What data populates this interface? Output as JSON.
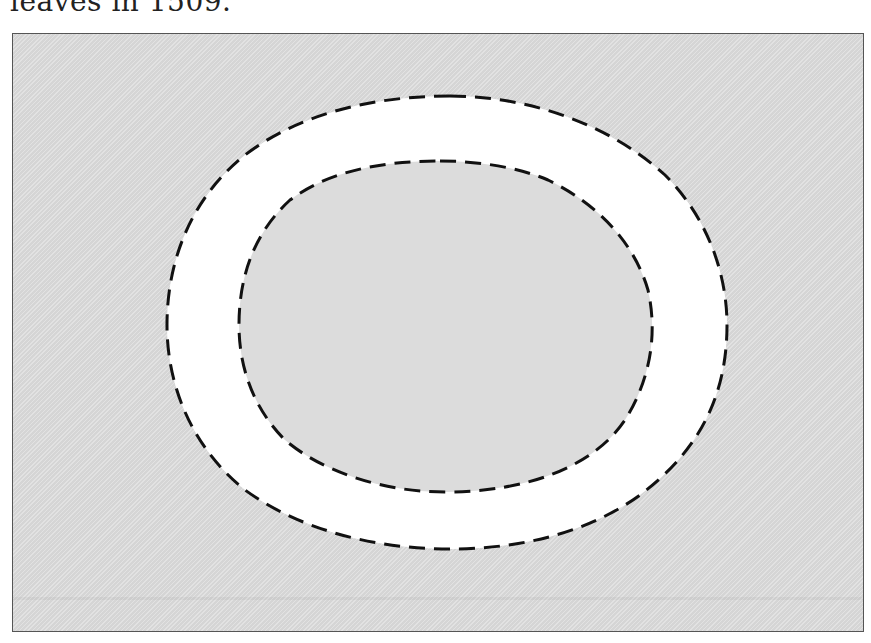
{
  "caption": {
    "text": "leaves in 1509."
  },
  "figure": {
    "frame": {
      "background_color": "#dcdcdc",
      "border_color": "#555555"
    },
    "outer_boundary": {
      "label": "outer dashed boundary",
      "style": "dashed",
      "stroke_color": "#111111",
      "fill_color": "#ffffff"
    },
    "inner_boundary": {
      "label": "inner dashed boundary",
      "style": "dashed",
      "stroke_color": "#111111",
      "fill_color": "#dcdcdc"
    },
    "ring_region": {
      "label": "white ring region between boundaries",
      "fill_color": "#ffffff"
    }
  }
}
